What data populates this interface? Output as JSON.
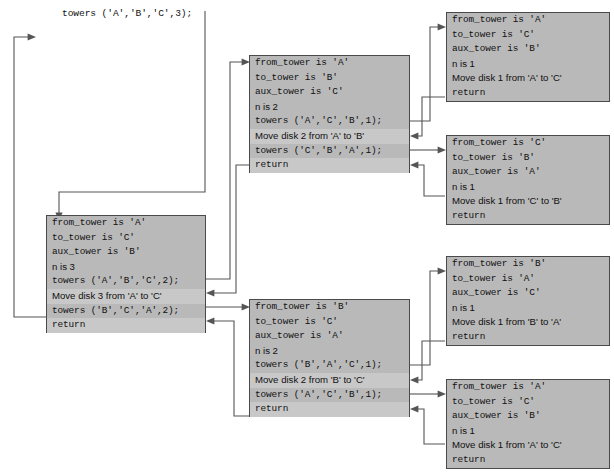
{
  "diagram": {
    "title_call": "towers ('A','B','C',3);",
    "type": "recursion-trace",
    "frames": [
      {
        "id": "root",
        "level": 0,
        "rows": [
          {
            "text": "from_tower is 'A'",
            "style": "mono",
            "highlight": false
          },
          {
            "text": "to_tower is 'C'",
            "style": "mono",
            "highlight": false
          },
          {
            "text": "aux_tower is 'B'",
            "style": "mono",
            "highlight": false
          },
          {
            "text": "n is 3",
            "style": "sans",
            "highlight": false
          },
          {
            "text": "towers ('A','B','C',2);",
            "style": "mono",
            "highlight": false
          },
          {
            "text": "Move disk 3 from 'A' to 'C'",
            "style": "sans",
            "highlight": true
          },
          {
            "text": "towers ('B','C','A',2);",
            "style": "mono",
            "highlight": false
          },
          {
            "text": "return",
            "style": "mono",
            "highlight": true
          }
        ]
      },
      {
        "id": "left-2",
        "level": 1,
        "rows": [
          {
            "text": "from_tower is 'A'",
            "style": "mono",
            "highlight": false
          },
          {
            "text": "to_tower is 'B'",
            "style": "mono",
            "highlight": false
          },
          {
            "text": "aux_tower is 'C'",
            "style": "mono",
            "highlight": false
          },
          {
            "text": "n is 2",
            "style": "sans",
            "highlight": false
          },
          {
            "text": "towers ('A','C','B',1);",
            "style": "mono",
            "highlight": false
          },
          {
            "text": "Move disk 2 from 'A' to 'B'",
            "style": "sans",
            "highlight": true
          },
          {
            "text": "towers ('C','B','A',1);",
            "style": "mono",
            "highlight": false
          },
          {
            "text": "return",
            "style": "mono",
            "highlight": true
          }
        ]
      },
      {
        "id": "right-2",
        "level": 1,
        "rows": [
          {
            "text": "from_tower is 'B'",
            "style": "mono",
            "highlight": false
          },
          {
            "text": "to_tower is 'C'",
            "style": "mono",
            "highlight": false
          },
          {
            "text": "aux_tower is 'A'",
            "style": "mono",
            "highlight": false
          },
          {
            "text": "n is 2",
            "style": "sans",
            "highlight": false
          },
          {
            "text": "towers ('B','A','C',1);",
            "style": "mono",
            "highlight": false
          },
          {
            "text": "Move disk 2 from 'B' to 'C'",
            "style": "sans",
            "highlight": true
          },
          {
            "text": "towers ('A','C','B',1);",
            "style": "mono",
            "highlight": false
          },
          {
            "text": "return",
            "style": "mono",
            "highlight": true
          }
        ]
      },
      {
        "id": "leaf-1",
        "level": 2,
        "rows": [
          {
            "text": "from_tower is 'A'",
            "style": "mono",
            "highlight": false
          },
          {
            "text": "to_tower is 'C'",
            "style": "mono",
            "highlight": false
          },
          {
            "text": "aux_tower is 'B'",
            "style": "mono",
            "highlight": false
          },
          {
            "text": "n is 1",
            "style": "sans",
            "highlight": false
          },
          {
            "text": "Move disk 1 from 'A' to 'C'",
            "style": "sans",
            "highlight": false
          },
          {
            "text": "return",
            "style": "mono",
            "highlight": false
          }
        ]
      },
      {
        "id": "leaf-2",
        "level": 2,
        "rows": [
          {
            "text": "from_tower is 'C'",
            "style": "mono",
            "highlight": false
          },
          {
            "text": "to_tower is 'B'",
            "style": "mono",
            "highlight": false
          },
          {
            "text": "aux_tower is 'A'",
            "style": "mono",
            "highlight": false
          },
          {
            "text": "n is 1",
            "style": "sans",
            "highlight": false
          },
          {
            "text": "Move disk 1 from 'C' to 'B'",
            "style": "sans",
            "highlight": false
          },
          {
            "text": "return",
            "style": "mono",
            "highlight": false
          }
        ]
      },
      {
        "id": "leaf-3",
        "level": 2,
        "rows": [
          {
            "text": "from_tower is 'B'",
            "style": "mono",
            "highlight": false
          },
          {
            "text": "to_tower is 'A'",
            "style": "mono",
            "highlight": false
          },
          {
            "text": "aux_tower is 'C'",
            "style": "mono",
            "highlight": false
          },
          {
            "text": "n is 1",
            "style": "sans",
            "highlight": false
          },
          {
            "text": "Move disk 1 from 'B' to 'A'",
            "style": "sans",
            "highlight": false
          },
          {
            "text": "return",
            "style": "mono",
            "highlight": false
          }
        ]
      },
      {
        "id": "leaf-4",
        "level": 2,
        "rows": [
          {
            "text": "from_tower is 'A'",
            "style": "mono",
            "highlight": false
          },
          {
            "text": "to_tower is 'C'",
            "style": "mono",
            "highlight": false
          },
          {
            "text": "aux_tower is 'B'",
            "style": "mono",
            "highlight": false
          },
          {
            "text": "n is 1",
            "style": "sans",
            "highlight": false
          },
          {
            "text": "Move disk 1 from 'A' to 'C'",
            "style": "sans",
            "highlight": false
          },
          {
            "text": "return",
            "style": "mono",
            "highlight": false
          }
        ]
      }
    ],
    "colors": {
      "frame_fill": "#b9b9b9",
      "frame_highlight": "#c8c8c8",
      "frame_border": "#4a4a4a",
      "wire": "#555555",
      "text": "#101010",
      "background": "#ffffff"
    }
  }
}
